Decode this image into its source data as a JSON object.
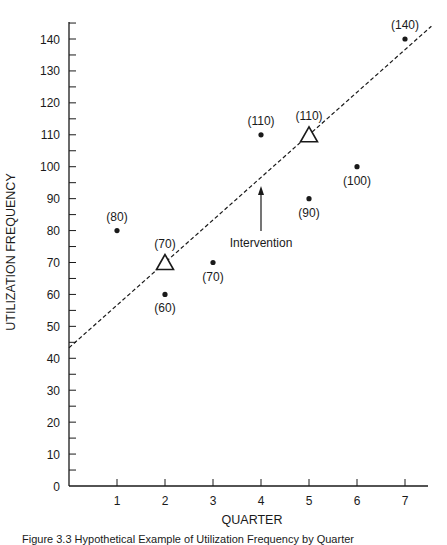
{
  "chart_data": {
    "type": "scatter",
    "title": "",
    "xlabel": "QUARTER",
    "ylabel": "UTILIZATION FREQUENCY",
    "xlim": [
      0,
      7.5
    ],
    "ylim": [
      0,
      145
    ],
    "x_ticks": [
      1,
      2,
      3,
      4,
      5,
      6,
      7
    ],
    "y_ticks": [
      0,
      10,
      20,
      30,
      40,
      50,
      60,
      70,
      80,
      90,
      100,
      110,
      120,
      130,
      140
    ],
    "y_minor_tick_step": 5,
    "grid": false,
    "legend": null,
    "series": [
      {
        "name": "Observed",
        "marker": "dot",
        "points": [
          {
            "x": 1,
            "y": 80,
            "label": "(80)",
            "label_pos": "above"
          },
          {
            "x": 2,
            "y": 60,
            "label": "(60)",
            "label_pos": "below"
          },
          {
            "x": 3,
            "y": 70,
            "label": "(70)",
            "label_pos": "below"
          },
          {
            "x": 4,
            "y": 110,
            "label": "(110)",
            "label_pos": "above"
          },
          {
            "x": 5,
            "y": 90,
            "label": "(90)",
            "label_pos": "below"
          },
          {
            "x": 6,
            "y": 100,
            "label": "(100)",
            "label_pos": "below"
          },
          {
            "x": 7,
            "y": 140,
            "label": "(140)",
            "label_pos": "above"
          }
        ]
      },
      {
        "name": "Trend reference",
        "marker": "triangle",
        "points": [
          {
            "x": 2,
            "y": 70,
            "label": "(70)",
            "label_pos": "above"
          },
          {
            "x": 5,
            "y": 110,
            "label": "(110)",
            "label_pos": "above"
          }
        ]
      }
    ],
    "trend_line": {
      "style": "dashed",
      "from": {
        "x": 0,
        "y": 43.3
      },
      "to": {
        "x": 7.55,
        "y": 144
      },
      "slope": 13.33
    },
    "annotations": [
      {
        "text": "Intervention",
        "type": "arrow",
        "x": 4,
        "arrow_from_y": 80,
        "arrow_to_y": 94
      }
    ]
  },
  "axes": {
    "x_title": "QUARTER",
    "y_title": "UTILIZATION FREQUENCY"
  },
  "annotation": {
    "intervention_label": "Intervention"
  },
  "caption": "Figure 3.3 Hypothetical Example of Utilization Frequency by Quarter"
}
